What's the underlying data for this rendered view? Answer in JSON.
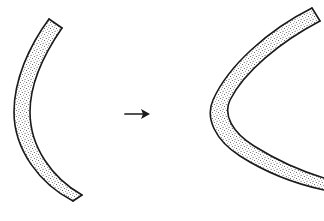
{
  "figure": {
    "background_color": "#ffffff",
    "ink_color": "#1a1a1a",
    "stipple_color": "#3a3a3a",
    "width": 324,
    "height": 221,
    "caption": "",
    "shapes": [
      {
        "id": "left-band",
        "label": "Gently curved band",
        "role": "before",
        "description": "Broad circular-arc band opening to the right, stipple filled",
        "opening_direction": "right",
        "curvature": "low",
        "band_thickness_px": 10,
        "fill_pattern": "stipple",
        "outer_edge_path": "M 49 19 C 29 46, 14 80, 14 112 C 14 150, 40 184, 73 201",
        "inner_edge_path": "M 62 28 C 44 54, 30 84, 30 112 C 30 147, 52 178, 82 195",
        "cap_start_path": "M 49 19 L 62 28",
        "cap_end_path": "M 73 201 L 82 195",
        "endpoints": {
          "top": [
            49,
            19
          ],
          "bottom": [
            73,
            201
          ],
          "vertex": [
            14,
            112
          ]
        }
      },
      {
        "id": "right-band",
        "label": "Sharply bent band",
        "role": "after",
        "description": "Tightly bent parabolic band opening to the right, stipple filled",
        "opening_direction": "right",
        "curvature": "high",
        "band_thickness_px": 10,
        "fill_pattern": "stipple",
        "outer_edge_path": "M 312 8 C 268 30, 228 66, 213 100 C 205 118, 215 140, 240 156 C 265 172, 296 184, 324 190",
        "inner_edge_path": "M 320 21 C 280 42, 244 72, 230 100 C 223 115, 232 132, 254 146 C 278 161, 304 172, 324 178",
        "cap_start_path": "M 312 8 L 320 21",
        "cap_end_path": "M 324 190 L 324 178",
        "endpoints": {
          "top": [
            312,
            8
          ],
          "bottom": [
            324,
            190
          ],
          "vertex": [
            208,
            112
          ]
        }
      }
    ],
    "arrow": {
      "id": "transform-arrow",
      "label": "transforms into",
      "glyph": "→",
      "direction": "right",
      "shaft_path": "M 125 114 L 147 114",
      "head_points": "150,114 141,109 143,114 141,119",
      "x_start": 125,
      "x_end": 150,
      "y": 114
    }
  }
}
